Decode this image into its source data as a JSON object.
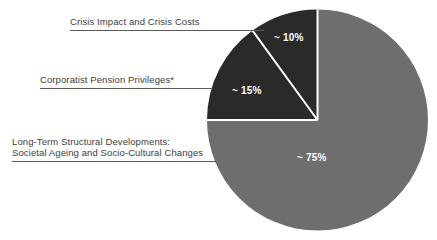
{
  "chart_data": {
    "type": "pie",
    "title": "",
    "subtitle": "",
    "xlabel": "",
    "ylabel": "",
    "legend_position": "callout-labels-left",
    "grid": false,
    "start_angle_deg": 0,
    "direction": "counter-clockwise",
    "categories": [
      "Crisis Impact and Crisis Costs",
      "Corporatist Pension Privileges*",
      "Long-Term Structural Developments: Societal Ageing and Socio-Cultural Changes"
    ],
    "values": [
      10,
      15,
      75
    ],
    "value_labels": [
      "~ 10%",
      "~ 15%",
      "~ 75%"
    ],
    "colors": [
      "#2a2a2a",
      "#2a2a2a",
      "#6e6e6e"
    ],
    "separator_color": "#ffffff",
    "background_color": "#ffffff",
    "label_text_color": "#3d3d3d",
    "slice_label_color": "#ffffff"
  },
  "callouts": [
    {
      "id": "crisis-impact",
      "lines": [
        "Crisis Impact and Crisis Costs"
      ],
      "value_label": "~ 10%"
    },
    {
      "id": "pension-privileges",
      "lines": [
        "Corporatist Pension Privileges*"
      ],
      "value_label": "~ 15%"
    },
    {
      "id": "structural-developments",
      "lines": [
        "Long-Term Structural Developments:",
        "Societal Ageing and Socio-Cultural Changes"
      ],
      "value_label": "~ 75%"
    }
  ]
}
